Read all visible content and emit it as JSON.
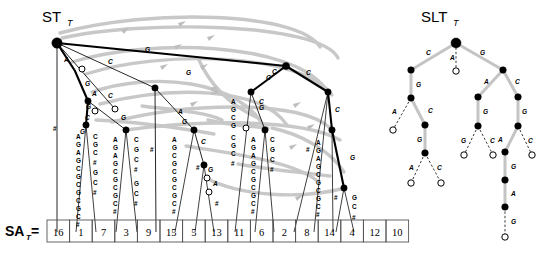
{
  "figure": {
    "suffix_tree_title": "ST",
    "suffix_tree_title_sub": "T",
    "slt_title": "SLT",
    "slt_title_sub": "T",
    "sa_label": "SA",
    "sa_label_sub": "T",
    "sa_equals": "=",
    "alphabet": [
      "A",
      "C",
      "G",
      "#"
    ]
  },
  "suffix_array": {
    "values": [
      16,
      1,
      7,
      3,
      9,
      15,
      5,
      13,
      11,
      6,
      2,
      8,
      14,
      4,
      12,
      10
    ]
  },
  "suffix_tree": {
    "root_edge_labels": [
      "A",
      "C",
      "G"
    ],
    "internal_edge_labels": [
      "G",
      "A",
      "G",
      "C",
      "G",
      "C",
      "G",
      "A",
      "G",
      "C",
      "G",
      "A",
      "C",
      "C",
      "G",
      "G",
      "C",
      "G",
      "C"
    ],
    "leaf_strings": [
      "#",
      "AGAGCGCGCGC#",
      "CGC#",
      "AGAGCGCGC#",
      "GC#",
      "#",
      "AGCGCGCGC#",
      "#",
      "#",
      "CGC#",
      "AGAGCGCGC#",
      "CGC#",
      "#",
      "AGCGCGC#",
      "#",
      "GC#"
    ],
    "short_labels": [
      "A",
      "C",
      "G",
      "#"
    ]
  },
  "slt": {
    "root_label": "",
    "edges": [
      {
        "label": "C",
        "kind": "solid"
      },
      {
        "label": "A",
        "kind": "dashed"
      },
      {
        "label": "G",
        "kind": "solid"
      },
      {
        "label": "G",
        "kind": "solid"
      },
      {
        "label": "A",
        "kind": "dashed"
      },
      {
        "label": "C",
        "kind": "solid"
      },
      {
        "label": "G",
        "kind": "solid"
      },
      {
        "label": "A",
        "kind": "dashed"
      },
      {
        "label": "C",
        "kind": "dashed"
      },
      {
        "label": "A",
        "kind": "solid"
      },
      {
        "label": "C",
        "kind": "solid"
      },
      {
        "label": "G",
        "kind": "solid"
      },
      {
        "label": "G",
        "kind": "dashed"
      },
      {
        "label": "C",
        "kind": "dashed"
      },
      {
        "label": "G",
        "kind": "solid"
      },
      {
        "label": "A",
        "kind": "solid"
      },
      {
        "label": "C",
        "kind": "dashed"
      },
      {
        "label": "G",
        "kind": "solid"
      },
      {
        "label": "A",
        "kind": "solid"
      },
      {
        "label": "G",
        "kind": "dashed"
      }
    ]
  },
  "colors": {
    "suffix_link": "#c8c8c8",
    "edge": "#000000",
    "node_internal": "#000000",
    "node_leaf": "#ffffff",
    "background": "#ffffff",
    "sa_box_border": "#555555"
  }
}
